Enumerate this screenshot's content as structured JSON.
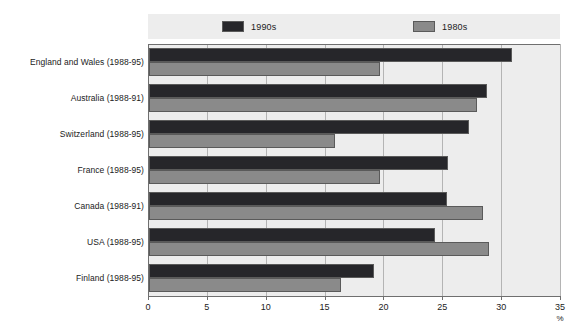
{
  "chart_data": {
    "type": "bar",
    "orientation": "horizontal",
    "title": "",
    "xlabel": "%",
    "ylabel": "",
    "xlim": [
      0,
      35
    ],
    "xticks": [
      0,
      5,
      10,
      15,
      20,
      25,
      30,
      35
    ],
    "xtick_labels": [
      "0",
      "5",
      "10",
      "15",
      "20",
      "25",
      "30",
      "35"
    ],
    "grid": true,
    "legend_position": "top",
    "categories": [
      "England and Wales (1988-95)",
      "Australia (1988-91)",
      "Switzerland (1988-95)",
      "France (1988-95)",
      "Canada (1988-91)",
      "USA (1988-95)",
      "Finland (1988-95)"
    ],
    "series": [
      {
        "name": "1990s",
        "color": "#26262a",
        "values": [
          30.8,
          28.7,
          27.2,
          25.4,
          25.3,
          24.3,
          19.1
        ]
      },
      {
        "name": "1980s",
        "color": "#8a8a8a",
        "values": [
          19.6,
          27.9,
          15.8,
          19.6,
          28.4,
          28.9,
          16.3
        ]
      }
    ]
  },
  "legend": {
    "items": [
      {
        "label": "1990s",
        "color": "#26262a"
      },
      {
        "label": "1980s",
        "color": "#8a8a8a"
      }
    ]
  },
  "colors": {
    "plot_background": "#ededed",
    "page_background": "#ffffff",
    "axis": "#6f6f6f",
    "gridline": "#b4b4b4",
    "text": "#1b1b1b"
  }
}
